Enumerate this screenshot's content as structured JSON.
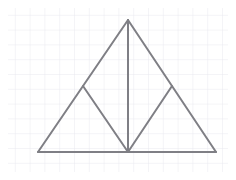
{
  "document": {
    "title": "Geometry Figure on Graph Paper",
    "description": "Isosceles triangle subdivided into four smaller triangles by a vertical median and two inner segments",
    "width": 236,
    "height": 180,
    "background_color": "#ffffff"
  },
  "grid": {
    "name": "graph-paper-grid",
    "visible": true,
    "cell_size": 14.8,
    "line_color": "#e9e9ef",
    "line_width": 1,
    "area": {
      "left": 8,
      "top": 8,
      "right": 228,
      "bottom": 172
    },
    "columns": 15,
    "rows": 12
  },
  "figure": {
    "name": "subdivided-triangle",
    "stroke_color": "#7f7f85",
    "stroke_width": 2,
    "fill": "none",
    "vertices": [
      {
        "id": "apex",
        "label": "A",
        "x": 128,
        "y": 20
      },
      {
        "id": "base-left",
        "label": "B",
        "x": 38,
        "y": 152
      },
      {
        "id": "base-right",
        "label": "C",
        "x": 216,
        "y": 152
      },
      {
        "id": "base-mid",
        "label": "M",
        "x": 128,
        "y": 152
      },
      {
        "id": "left-side-mid",
        "label": "D",
        "x": 83,
        "y": 86
      },
      {
        "id": "right-side-mid",
        "label": "E",
        "x": 172,
        "y": 86
      }
    ],
    "segments": [
      {
        "id": "left-side",
        "name": "outer-left-edge",
        "from": "apex",
        "to": "base-left",
        "x1": 128,
        "y1": 20,
        "x2": 38,
        "y2": 152
      },
      {
        "id": "right-side",
        "name": "outer-right-edge",
        "from": "apex",
        "to": "base-right",
        "x1": 128,
        "y1": 20,
        "x2": 216,
        "y2": 152
      },
      {
        "id": "base",
        "name": "outer-base-edge",
        "from": "base-left",
        "to": "base-right",
        "x1": 38,
        "y1": 152,
        "x2": 216,
        "y2": 152
      },
      {
        "id": "median",
        "name": "vertical-median",
        "from": "apex",
        "to": "base-mid",
        "x1": 128,
        "y1": 20,
        "x2": 128,
        "y2": 152
      },
      {
        "id": "left-inner",
        "name": "left-inner-diagonal",
        "from": "left-side-mid",
        "to": "base-mid",
        "x1": 83,
        "y1": 86,
        "x2": 128,
        "y2": 152
      },
      {
        "id": "right-inner",
        "name": "right-inner-diagonal",
        "from": "right-side-mid",
        "to": "base-mid",
        "x1": 172,
        "y1": 86,
        "x2": 128,
        "y2": 152
      }
    ],
    "regions": [
      {
        "id": "upper-left",
        "name": "upper-left-triangle",
        "vertices": [
          "apex",
          "left-side-mid",
          "base-mid"
        ]
      },
      {
        "id": "lower-left",
        "name": "lower-left-triangle",
        "vertices": [
          "left-side-mid",
          "base-left",
          "base-mid"
        ]
      },
      {
        "id": "upper-right",
        "name": "upper-right-triangle",
        "vertices": [
          "apex",
          "base-mid",
          "right-side-mid"
        ]
      },
      {
        "id": "lower-right",
        "name": "lower-right-triangle",
        "vertices": [
          "right-side-mid",
          "base-mid",
          "base-right"
        ]
      }
    ],
    "region_count": 4
  }
}
